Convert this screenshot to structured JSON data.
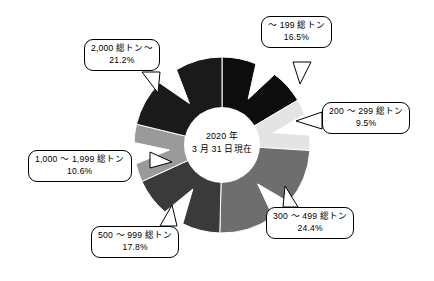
{
  "figure": {
    "title": "",
    "center_note": {
      "line1": "2020 年",
      "line2": "3 月 31 日現在"
    },
    "background_color": "#ffffff"
  },
  "chart_data": {
    "type": "pie",
    "title": "",
    "subtitle": "",
    "xlabel": "",
    "ylabel": "",
    "donut": true,
    "inner_radius_ratio": 0.43,
    "start_angle_deg": 0,
    "direction": "clockwise",
    "center_text": "2020 年 3 月 31 日現在",
    "legend_position": "callouts",
    "labels": [
      "～ 199 総トン",
      "200 ～ 299 総トン",
      "300 ～ 499 総トン",
      "500 ～ 999 総トン",
      "1,000 ～ 1,999 総トン",
      "2,000 総トン～"
    ],
    "values": [
      16.5,
      9.5,
      24.4,
      17.8,
      10.6,
      21.2
    ],
    "value_labels": [
      "16.5%",
      "9.5%",
      "24.4%",
      "17.8%",
      "10.6%",
      "21.2%"
    ],
    "colors": [
      "#0d0d0d",
      "#e4e4e4",
      "#6e6e6e",
      "#3a3a3a",
      "#9a9a9a",
      "#1a1a1a"
    ],
    "unit": "%",
    "slices": [
      {
        "label": "～ 199 総トン",
        "value": 16.5,
        "value_label": "16.5%",
        "color": "#0d0d0d"
      },
      {
        "label": "200 ～ 299 総トン",
        "value": 9.5,
        "value_label": "9.5%",
        "color": "#e4e4e4"
      },
      {
        "label": "300 ～ 499 総トン",
        "value": 24.4,
        "value_label": "24.4%",
        "color": "#6e6e6e"
      },
      {
        "label": "500 ～ 999 総トン",
        "value": 17.8,
        "value_label": "17.8%",
        "color": "#3a3a3a"
      },
      {
        "label": "1,000 ～ 1,999 総トン",
        "value": 10.6,
        "value_label": "10.6%",
        "color": "#9a9a9a"
      },
      {
        "label": "2,000 総トン～",
        "value": 21.2,
        "value_label": "21.2%",
        "color": "#1a1a1a"
      }
    ]
  }
}
